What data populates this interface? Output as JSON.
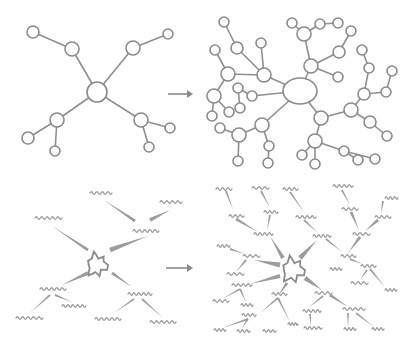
{
  "diagram": {
    "title": "",
    "colors": {
      "background": "#ffffff",
      "stroke": "#8a8a8a",
      "wave": "#9a9a9a"
    },
    "panels": [
      {
        "id": "top-left",
        "label": "simple node graph"
      },
      {
        "id": "top-right",
        "label": "expanded node graph"
      },
      {
        "id": "bottom-left",
        "label": "simple idea map"
      },
      {
        "id": "bottom-right",
        "label": "expanded idea map"
      }
    ],
    "arrows": [
      {
        "x1": 168,
        "y1": 94,
        "x2": 193,
        "y2": 94
      },
      {
        "x1": 166,
        "y1": 268,
        "x2": 193,
        "y2": 268
      }
    ],
    "top_left": {
      "nodes": [
        {
          "x": 97,
          "y": 92,
          "r": 10
        },
        {
          "x": 33,
          "y": 32,
          "r": 6
        },
        {
          "x": 72,
          "y": 49,
          "r": 7
        },
        {
          "x": 133,
          "y": 48,
          "r": 7
        },
        {
          "x": 168,
          "y": 34,
          "r": 5
        },
        {
          "x": 57,
          "y": 120,
          "r": 7
        },
        {
          "x": 28,
          "y": 138,
          "r": 6
        },
        {
          "x": 55,
          "y": 151,
          "r": 5
        },
        {
          "x": 141,
          "y": 120,
          "r": 7
        },
        {
          "x": 170,
          "y": 128,
          "r": 5
        },
        {
          "x": 149,
          "y": 147,
          "r": 5
        }
      ],
      "edges": [
        [
          0,
          2
        ],
        [
          2,
          1
        ],
        [
          0,
          3
        ],
        [
          3,
          4
        ],
        [
          0,
          5
        ],
        [
          5,
          6
        ],
        [
          5,
          7
        ],
        [
          0,
          8
        ],
        [
          8,
          9
        ],
        [
          8,
          10
        ]
      ]
    },
    "top_right": {
      "nodes": [
        {
          "x": 300,
          "y": 91,
          "r": 15,
          "rx": 17,
          "ry": 13
        },
        {
          "x": 264,
          "y": 75,
          "r": 7
        },
        {
          "x": 237,
          "y": 48,
          "r": 6
        },
        {
          "x": 224,
          "y": 22,
          "r": 5
        },
        {
          "x": 261,
          "y": 43,
          "r": 5
        },
        {
          "x": 228,
          "y": 74,
          "r": 7
        },
        {
          "x": 215,
          "y": 50,
          "r": 5
        },
        {
          "x": 214,
          "y": 96,
          "r": 7
        },
        {
          "x": 212,
          "y": 116,
          "r": 5
        },
        {
          "x": 229,
          "y": 112,
          "r": 5
        },
        {
          "x": 252,
          "y": 96,
          "r": 5
        },
        {
          "x": 238,
          "y": 88,
          "r": 5
        },
        {
          "x": 240,
          "y": 108,
          "r": 5
        },
        {
          "x": 262,
          "y": 125,
          "r": 7
        },
        {
          "x": 239,
          "y": 135,
          "r": 7
        },
        {
          "x": 220,
          "y": 128,
          "r": 5
        },
        {
          "x": 238,
          "y": 161,
          "r": 5
        },
        {
          "x": 269,
          "y": 146,
          "r": 5
        },
        {
          "x": 268,
          "y": 163,
          "r": 5
        },
        {
          "x": 311,
          "y": 66,
          "r": 7
        },
        {
          "x": 304,
          "y": 34,
          "r": 7
        },
        {
          "x": 292,
          "y": 23,
          "r": 5
        },
        {
          "x": 320,
          "y": 24,
          "r": 5
        },
        {
          "x": 338,
          "y": 23,
          "r": 5
        },
        {
          "x": 339,
          "y": 52,
          "r": 6
        },
        {
          "x": 351,
          "y": 31,
          "r": 5
        },
        {
          "x": 338,
          "y": 77,
          "r": 5
        },
        {
          "x": 321,
          "y": 118,
          "r": 7
        },
        {
          "x": 315,
          "y": 141,
          "r": 7
        },
        {
          "x": 302,
          "y": 155,
          "r": 5
        },
        {
          "x": 315,
          "y": 164,
          "r": 5
        },
        {
          "x": 344,
          "y": 151,
          "r": 5
        },
        {
          "x": 358,
          "y": 160,
          "r": 5
        },
        {
          "x": 375,
          "y": 159,
          "r": 5
        },
        {
          "x": 351,
          "y": 110,
          "r": 7
        },
        {
          "x": 364,
          "y": 94,
          "r": 6
        },
        {
          "x": 369,
          "y": 68,
          "r": 5
        },
        {
          "x": 362,
          "y": 50,
          "r": 5
        },
        {
          "x": 386,
          "y": 92,
          "r": 5
        },
        {
          "x": 392,
          "y": 71,
          "r": 5
        },
        {
          "x": 370,
          "y": 122,
          "r": 6
        },
        {
          "x": 387,
          "y": 136,
          "r": 5
        }
      ],
      "edges": [
        [
          0,
          1
        ],
        [
          1,
          2
        ],
        [
          2,
          3
        ],
        [
          1,
          4
        ],
        [
          1,
          5
        ],
        [
          5,
          6
        ],
        [
          5,
          7
        ],
        [
          7,
          8
        ],
        [
          7,
          9
        ],
        [
          0,
          10
        ],
        [
          10,
          11
        ],
        [
          11,
          12
        ],
        [
          0,
          13
        ],
        [
          13,
          14
        ],
        [
          14,
          15
        ],
        [
          14,
          16
        ],
        [
          13,
          17
        ],
        [
          17,
          18
        ],
        [
          0,
          19
        ],
        [
          19,
          20
        ],
        [
          20,
          21
        ],
        [
          20,
          22
        ],
        [
          22,
          23
        ],
        [
          19,
          24
        ],
        [
          24,
          25
        ],
        [
          19,
          26
        ],
        [
          0,
          27
        ],
        [
          27,
          28
        ],
        [
          28,
          29
        ],
        [
          28,
          30
        ],
        [
          28,
          31
        ],
        [
          31,
          32
        ],
        [
          31,
          33
        ],
        [
          27,
          34
        ],
        [
          34,
          35
        ],
        [
          35,
          36
        ],
        [
          36,
          37
        ],
        [
          35,
          38
        ],
        [
          38,
          39
        ],
        [
          34,
          40
        ],
        [
          40,
          41
        ]
      ]
    },
    "bottom_left": {
      "center": {
        "x": 97,
        "y": 265
      },
      "labels": [
        {
          "x": 35,
          "y": 218,
          "w": 27
        },
        {
          "x": 90,
          "y": 193,
          "w": 22
        },
        {
          "x": 160,
          "y": 202,
          "w": 22
        },
        {
          "x": 133,
          "y": 231,
          "w": 26
        },
        {
          "x": 40,
          "y": 289,
          "w": 26
        },
        {
          "x": 62,
          "y": 306,
          "w": 24
        },
        {
          "x": 16,
          "y": 318,
          "w": 27
        },
        {
          "x": 128,
          "y": 294,
          "w": 24
        },
        {
          "x": 95,
          "y": 319,
          "w": 26
        },
        {
          "x": 150,
          "y": 322,
          "w": 26
        }
      ],
      "wedges": [
        {
          "x1": 88,
          "y1": 250,
          "x2": 52,
          "y2": 226,
          "w": 3
        },
        {
          "x1": 110,
          "y1": 250,
          "x2": 148,
          "y2": 236,
          "w": 5
        },
        {
          "x1": 135,
          "y1": 221,
          "x2": 104,
          "y2": 200,
          "w": 3
        },
        {
          "x1": 150,
          "y1": 220,
          "x2": 170,
          "y2": 210,
          "w": 4
        },
        {
          "x1": 88,
          "y1": 273,
          "x2": 62,
          "y2": 285,
          "w": 4
        },
        {
          "x1": 112,
          "y1": 273,
          "x2": 132,
          "y2": 287,
          "w": 3
        },
        {
          "x1": 50,
          "y1": 295,
          "x2": 30,
          "y2": 313,
          "w": 2
        },
        {
          "x1": 55,
          "y1": 295,
          "x2": 72,
          "y2": 302,
          "w": 2
        },
        {
          "x1": 134,
          "y1": 299,
          "x2": 114,
          "y2": 313,
          "w": 2
        },
        {
          "x1": 142,
          "y1": 299,
          "x2": 163,
          "y2": 318,
          "w": 2
        }
      ]
    },
    "bottom_right": {
      "center": {
        "x": 293,
        "y": 270
      },
      "labels": [
        {
          "x": 216,
          "y": 189,
          "w": 16
        },
        {
          "x": 252,
          "y": 188,
          "w": 17
        },
        {
          "x": 283,
          "y": 189,
          "w": 15
        },
        {
          "x": 333,
          "y": 186,
          "w": 20
        },
        {
          "x": 385,
          "y": 198,
          "w": 13
        },
        {
          "x": 229,
          "y": 216,
          "w": 15
        },
        {
          "x": 264,
          "y": 212,
          "w": 14
        },
        {
          "x": 296,
          "y": 217,
          "w": 20
        },
        {
          "x": 342,
          "y": 209,
          "w": 16
        },
        {
          "x": 375,
          "y": 217,
          "w": 16
        },
        {
          "x": 254,
          "y": 234,
          "w": 19
        },
        {
          "x": 313,
          "y": 236,
          "w": 18
        },
        {
          "x": 353,
          "y": 234,
          "w": 17
        },
        {
          "x": 217,
          "y": 246,
          "w": 13
        },
        {
          "x": 243,
          "y": 256,
          "w": 17
        },
        {
          "x": 341,
          "y": 256,
          "w": 15
        },
        {
          "x": 330,
          "y": 269,
          "w": 12
        },
        {
          "x": 361,
          "y": 266,
          "w": 15
        },
        {
          "x": 227,
          "y": 274,
          "w": 17
        },
        {
          "x": 351,
          "y": 283,
          "w": 17
        },
        {
          "x": 385,
          "y": 290,
          "w": 12
        },
        {
          "x": 232,
          "y": 285,
          "w": 20
        },
        {
          "x": 315,
          "y": 293,
          "w": 17
        },
        {
          "x": 213,
          "y": 301,
          "w": 16
        },
        {
          "x": 241,
          "y": 305,
          "w": 12
        },
        {
          "x": 272,
          "y": 294,
          "w": 15
        },
        {
          "x": 303,
          "y": 311,
          "w": 18
        },
        {
          "x": 343,
          "y": 309,
          "w": 22
        },
        {
          "x": 242,
          "y": 315,
          "w": 14
        },
        {
          "x": 214,
          "y": 330,
          "w": 12
        },
        {
          "x": 237,
          "y": 331,
          "w": 13
        },
        {
          "x": 263,
          "y": 331,
          "w": 13
        },
        {
          "x": 288,
          "y": 324,
          "w": 10
        },
        {
          "x": 304,
          "y": 328,
          "w": 18
        },
        {
          "x": 344,
          "y": 329,
          "w": 12
        },
        {
          "x": 372,
          "y": 329,
          "w": 12
        }
      ],
      "wedges": [
        {
          "x1": 283,
          "y1": 258,
          "x2": 270,
          "y2": 236,
          "w": 4
        },
        {
          "x1": 300,
          "y1": 258,
          "x2": 317,
          "y2": 240,
          "w": 5
        },
        {
          "x1": 280,
          "y1": 265,
          "x2": 254,
          "y2": 260,
          "w": 5
        },
        {
          "x1": 280,
          "y1": 276,
          "x2": 250,
          "y2": 284,
          "w": 4
        },
        {
          "x1": 287,
          "y1": 283,
          "x2": 278,
          "y2": 296,
          "w": 3
        },
        {
          "x1": 305,
          "y1": 278,
          "x2": 322,
          "y2": 290,
          "w": 5
        },
        {
          "x1": 226,
          "y1": 191,
          "x2": 233,
          "y2": 210,
          "w": 2
        },
        {
          "x1": 261,
          "y1": 191,
          "x2": 270,
          "y2": 208,
          "w": 2
        },
        {
          "x1": 290,
          "y1": 192,
          "x2": 304,
          "y2": 212,
          "w": 2
        },
        {
          "x1": 236,
          "y1": 219,
          "x2": 258,
          "y2": 232,
          "w": 3
        },
        {
          "x1": 270,
          "y1": 215,
          "x2": 267,
          "y2": 230,
          "w": 2
        },
        {
          "x1": 304,
          "y1": 220,
          "x2": 318,
          "y2": 233,
          "w": 2
        },
        {
          "x1": 342,
          "y1": 190,
          "x2": 350,
          "y2": 205,
          "w": 2
        },
        {
          "x1": 351,
          "y1": 212,
          "x2": 359,
          "y2": 230,
          "w": 3
        },
        {
          "x1": 383,
          "y1": 201,
          "x2": 381,
          "y2": 214,
          "w": 2
        },
        {
          "x1": 378,
          "y1": 220,
          "x2": 365,
          "y2": 231,
          "w": 3
        },
        {
          "x1": 326,
          "y1": 239,
          "x2": 342,
          "y2": 252,
          "w": 2
        },
        {
          "x1": 360,
          "y1": 237,
          "x2": 348,
          "y2": 253,
          "w": 3
        },
        {
          "x1": 350,
          "y1": 259,
          "x2": 362,
          "y2": 264,
          "w": 2
        },
        {
          "x1": 367,
          "y1": 270,
          "x2": 360,
          "y2": 280,
          "w": 2
        },
        {
          "x1": 370,
          "y1": 269,
          "x2": 385,
          "y2": 287,
          "w": 2
        },
        {
          "x1": 230,
          "y1": 249,
          "x2": 245,
          "y2": 254,
          "w": 2
        },
        {
          "x1": 246,
          "y1": 260,
          "x2": 236,
          "y2": 272,
          "w": 2
        },
        {
          "x1": 240,
          "y1": 289,
          "x2": 222,
          "y2": 299,
          "w": 2
        },
        {
          "x1": 240,
          "y1": 289,
          "x2": 246,
          "y2": 302,
          "w": 2
        },
        {
          "x1": 278,
          "y1": 298,
          "x2": 260,
          "y2": 313,
          "w": 2
        },
        {
          "x1": 278,
          "y1": 298,
          "x2": 290,
          "y2": 322,
          "w": 2
        },
        {
          "x1": 248,
          "y1": 319,
          "x2": 222,
          "y2": 328,
          "w": 2
        },
        {
          "x1": 248,
          "y1": 319,
          "x2": 242,
          "y2": 328,
          "w": 2
        },
        {
          "x1": 323,
          "y1": 296,
          "x2": 308,
          "y2": 308,
          "w": 2
        },
        {
          "x1": 330,
          "y1": 295,
          "x2": 348,
          "y2": 307,
          "w": 3
        },
        {
          "x1": 310,
          "y1": 314,
          "x2": 311,
          "y2": 326,
          "w": 2
        },
        {
          "x1": 348,
          "y1": 313,
          "x2": 348,
          "y2": 327,
          "w": 2
        },
        {
          "x1": 356,
          "y1": 313,
          "x2": 374,
          "y2": 327,
          "w": 2
        }
      ]
    }
  }
}
